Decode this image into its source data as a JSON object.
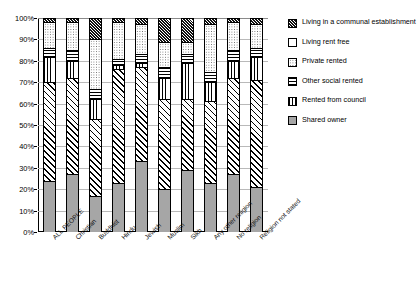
{
  "chart_data": {
    "type": "bar",
    "subtype": "stacked-percent",
    "title": "",
    "xlabel": "",
    "ylabel": "",
    "ylim": [
      0,
      100
    ],
    "ytick_labels": [
      "100%",
      "90%",
      "80%",
      "70%",
      "60%",
      "50%",
      "40%",
      "30%",
      "20%",
      "10%",
      "0%"
    ],
    "ytick_values": [
      100,
      90,
      80,
      70,
      60,
      50,
      40,
      30,
      20,
      10,
      0
    ],
    "grid": true,
    "legend_position": "right",
    "categories": [
      "ALL PEOPLE",
      "Christian",
      "Buddhist",
      "Hindu",
      "Jewish",
      "Muslim",
      "Sikh",
      "Any other religion",
      "No religion",
      "Religion not stated"
    ],
    "series": [
      {
        "name": "Shared owner",
        "pattern": "solid-grey",
        "color": "#a6a6a6",
        "values": [
          24,
          27,
          17,
          23,
          33,
          20,
          29,
          23,
          27,
          21
        ]
      },
      {
        "name": "Rented from council",
        "pattern": "diagonal-hatch",
        "color": "#ffffff",
        "values": [
          46,
          45,
          36,
          53,
          44,
          42,
          33,
          38,
          45,
          50
        ]
      },
      {
        "name": "Other social rented",
        "pattern": "vertical-lines",
        "color": "#ffffff",
        "values": [
          12,
          8,
          9,
          2,
          2,
          10,
          17,
          9,
          8,
          11
        ]
      },
      {
        "name": "Private rented",
        "pattern": "horizontal-lines",
        "color": "#ffffff",
        "values": [
          4,
          5,
          5,
          3,
          4,
          5,
          4,
          5,
          5,
          4
        ]
      },
      {
        "name": "Living rent free",
        "pattern": "dotted",
        "color": "#ffffff",
        "values": [
          12,
          13,
          23,
          17,
          14,
          12,
          6,
          22,
          13,
          11
        ]
      },
      {
        "name": "Living in a communal establishment",
        "pattern": "cross-hatch",
        "color": "#ffffff",
        "values": [
          2,
          2,
          10,
          2,
          3,
          11,
          11,
          3,
          2,
          3
        ]
      }
    ],
    "legend": [
      {
        "label": "Living in a communal establishment",
        "pattern": "cross-hatch"
      },
      {
        "label": "Living rent free",
        "pattern": "white"
      },
      {
        "label": "Private rented",
        "pattern": "dotted"
      },
      {
        "label": "Other social rented",
        "pattern": "horizontal-lines"
      },
      {
        "label": "Rented from council",
        "pattern": "vertical-lines"
      },
      {
        "label": "Shared owner",
        "pattern": "solid-grey"
      }
    ]
  }
}
